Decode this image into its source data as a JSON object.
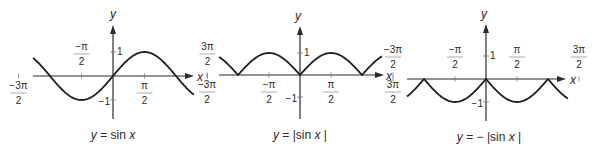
{
  "colors": {
    "ink": "#2a2a2a",
    "background": "#ffffff"
  },
  "chart_data": [
    {
      "type": "line",
      "title": "y = sin x",
      "caption": {
        "pre": "y",
        "mid": " = sin ",
        "post": "x",
        "tail": ""
      },
      "function": "sin",
      "xlabel": "x",
      "ylabel": "y",
      "xlim": [
        -4.712,
        5.026
      ],
      "ylim": [
        -1,
        1
      ],
      "x_ticks": [
        {
          "num": "−3π",
          "den": "2",
          "value": -4.712,
          "pos": "below"
        },
        {
          "num": "−π",
          "den": "2",
          "value": -1.571,
          "pos": "above"
        },
        {
          "num": "π",
          "den": "2",
          "value": 1.571,
          "pos": "below"
        },
        {
          "num": "3π",
          "den": "2",
          "value": 4.712,
          "pos": "above"
        }
      ],
      "y_ticks": [
        {
          "label": "1",
          "value": 1
        },
        {
          "label": "−1",
          "value": -1
        }
      ],
      "frame": {
        "ox": 113,
        "oy": 76,
        "unit_x": 20.05,
        "unit_y": 24,
        "x_start": 33,
        "x_end": 194,
        "y_top": 25,
        "y_bottom": 119,
        "curve_x0": 33,
        "curve_x1": 194,
        "ylabel_x": 113,
        "ylabel_y": 18,
        "xlabel_x": 200,
        "xlabel_y": 81,
        "caption_x": 113,
        "caption_y": 139
      }
    },
    {
      "type": "line",
      "title": "y = |sin x|",
      "caption": {
        "pre": "y",
        "mid": " =  |sin ",
        "post": "x",
        "tail": " |"
      },
      "function": "abs_sin",
      "xlabel": "x",
      "ylabel": "y",
      "xlim": [
        -5.13,
        5.13
      ],
      "ylim": [
        -1,
        1
      ],
      "x_ticks": [
        {
          "num": "−3π",
          "den": "2",
          "value": -4.712,
          "pos": "below"
        },
        {
          "num": "−π",
          "den": "2",
          "value": -1.571,
          "pos": "below"
        },
        {
          "num": "π",
          "den": "2",
          "value": 1.571,
          "pos": "below"
        },
        {
          "num": "3π",
          "den": "2",
          "value": 4.712,
          "pos": "below"
        }
      ],
      "y_ticks": [
        {
          "label": "1",
          "value": 1
        },
        {
          "label": "−1",
          "value": -1
        }
      ],
      "frame": {
        "ox": 300,
        "oy": 75,
        "unit_x": 19.73,
        "unit_y": 22,
        "x_start": 219,
        "x_end": 384,
        "y_top": 26,
        "y_bottom": 119,
        "curve_x0": 219,
        "curve_x1": 382,
        "ylabel_x": 298,
        "ylabel_y": 20,
        "xlabel_x": 389,
        "xlabel_y": 80,
        "caption_x": 300,
        "caption_y": 139
      }
    },
    {
      "type": "line",
      "title": "y = −|sin x|",
      "caption": {
        "pre": "y",
        "mid": " = − |sin ",
        "post": "x",
        "tail": " |"
      },
      "function": "neg_abs_sin",
      "xlabel": "x",
      "ylabel": "y",
      "xlim": [
        -5.0,
        5.1
      ],
      "ylim": [
        -1,
        1
      ],
      "x_ticks": [
        {
          "num": "−3π",
          "den": "2",
          "value": -4.712,
          "pos": "above"
        },
        {
          "num": "−π",
          "den": "2",
          "value": -1.571,
          "pos": "above"
        },
        {
          "num": "π",
          "den": "2",
          "value": 1.571,
          "pos": "above"
        },
        {
          "num": "3π",
          "den": "2",
          "value": 4.712,
          "pos": "above"
        }
      ],
      "y_ticks": [
        {
          "label": "1",
          "value": 1
        },
        {
          "label": "−1",
          "value": -1
        }
      ],
      "frame": {
        "ox": 486,
        "oy": 79,
        "unit_x": 19.73,
        "unit_y": 23,
        "x_start": 407,
        "x_end": 566,
        "y_top": 24,
        "y_bottom": 121,
        "curve_x0": 407,
        "curve_x1": 568,
        "ylabel_x": 484,
        "ylabel_y": 18,
        "xlabel_x": 573,
        "xlabel_y": 84,
        "caption_x": 489,
        "caption_y": 141
      }
    }
  ]
}
